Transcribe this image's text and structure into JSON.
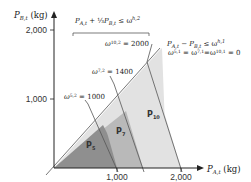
{
  "figure": {
    "y_axis_label": "P_B,t (kg)",
    "x_axis_label": "P_A,t (kg)",
    "y_ticks": [
      {
        "label": "2,000",
        "value": 2000
      },
      {
        "label": "1,000",
        "value": 1000
      }
    ],
    "x_ticks": [
      {
        "label": "1,000",
        "value": 1000
      },
      {
        "label": "2,000",
        "value": 2000
      }
    ],
    "constraint_top": "P_A,t + (1/3) P_B,t ≤ ω^{h,2}",
    "constraint_diag": "P_A,t − P_B,t ≤ ω^{h,1}",
    "constraint_diag_values": "ω^{5,1} = ω^{7,1} = ω^{10,1} = 0",
    "line_labels": [
      {
        "id": "w52",
        "text": "ω^{5,2} = 1000",
        "omega": 1000
      },
      {
        "id": "w72",
        "text": "ω^{7,2} = 1400",
        "omega": 1400
      },
      {
        "id": "w102",
        "text": "ω^{10,2} = 2000",
        "omega": 2000
      }
    ],
    "regions": [
      {
        "id": "P5",
        "label": "P5",
        "color": "#8c8c8c"
      },
      {
        "id": "P7",
        "label": "P7",
        "color": "#b4b4b4"
      },
      {
        "id": "P10",
        "label": "P10",
        "color": "#dcdcdc"
      }
    ]
  },
  "text": {
    "y_axis_main": "P",
    "y_axis_sub": "B,t",
    "y_axis_unit": " (kg)",
    "x_axis_main": "P",
    "x_axis_sub": "A,t",
    "x_axis_unit": " (kg)",
    "ytick_2000": "2,000",
    "ytick_1000": "1,000",
    "xtick_1000": "1,000",
    "xtick_2000": "2,000",
    "top_eq_p1": "P",
    "top_eq_s1": "A,t",
    "top_eq_plus": " + ",
    "top_eq_frac": "⅓",
    "top_eq_p2": "P",
    "top_eq_s2": "B,t",
    "top_eq_le": " ≤ ω",
    "top_eq_sup": "h,2",
    "diag_p1": "P",
    "diag_s1": "A,t",
    "diag_minus": " − ",
    "diag_p2": "P",
    "diag_s2": "B,t",
    "diag_le": " ≤ ω",
    "diag_sup": "h,1",
    "diag_vals_w": "ω",
    "diag_vals_s1": "5,1",
    "diag_vals_m1": " = ω",
    "diag_vals_s2": "7,1",
    "diag_vals_m2": "=ω",
    "diag_vals_s3": "10,1",
    "diag_vals_end": " = 0",
    "w52_w": "ω",
    "w52_sup": "5,2",
    "w52_val": " = 1000",
    "w72_w": "ω",
    "w72_sup": "7,2",
    "w72_val": " = 1400",
    "w102_w": "ω",
    "w102_sup": "10,2",
    "w102_val": " = 2000",
    "region_p5": "P",
    "region_p5_sub": "5",
    "region_p7": "P",
    "region_p7_sub": "7",
    "region_p10": "P",
    "region_p10_sub": "10"
  }
}
